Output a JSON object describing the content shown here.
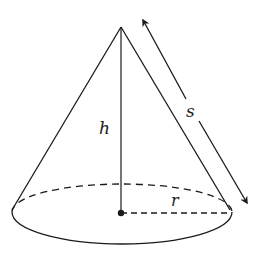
{
  "diagram": {
    "labels": {
      "height": "h",
      "slant_height": "s",
      "radius": "r"
    },
    "colors": {
      "stroke": "#1a1a1a",
      "background": "#ffffff"
    }
  }
}
